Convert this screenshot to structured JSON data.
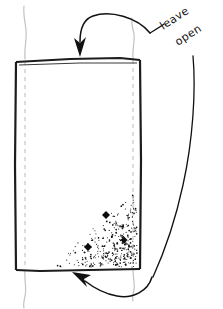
{
  "sketch": {
    "title": "leave-open-mattress-sketch",
    "background_color": "#ffffff",
    "ink_color": "#111111",
    "guide_color": "#b9b9b9"
  },
  "annotations": {
    "leave_open": {
      "line1": "leave",
      "line2": "open",
      "rotation_deg": -33
    }
  },
  "arrows": [
    {
      "name": "top-arrow",
      "direction": "down",
      "points_to": "top-edge"
    },
    {
      "name": "bottom-arrow",
      "direction": "up-left",
      "points_to": "bottom-edge"
    }
  ],
  "shape": {
    "name": "rectangle-panel",
    "left": 16,
    "top": 59,
    "right": 140,
    "bottom": 270
  },
  "markers": {
    "name": "diamond-markers",
    "shape": "diamond",
    "count": 3,
    "color": "#0d0d0d",
    "points": [
      {
        "x": 106,
        "y": 215,
        "size": 8
      },
      {
        "x": 88,
        "y": 247,
        "size": 8
      },
      {
        "x": 124,
        "y": 240,
        "size": 7
      }
    ]
  },
  "stipple": {
    "name": "stipple-shading",
    "description": "triangular dotted shading in lower-right of panel",
    "dot_color": "#141414",
    "region": {
      "x": 52,
      "y": 190,
      "width": 88,
      "height": 80
    }
  }
}
